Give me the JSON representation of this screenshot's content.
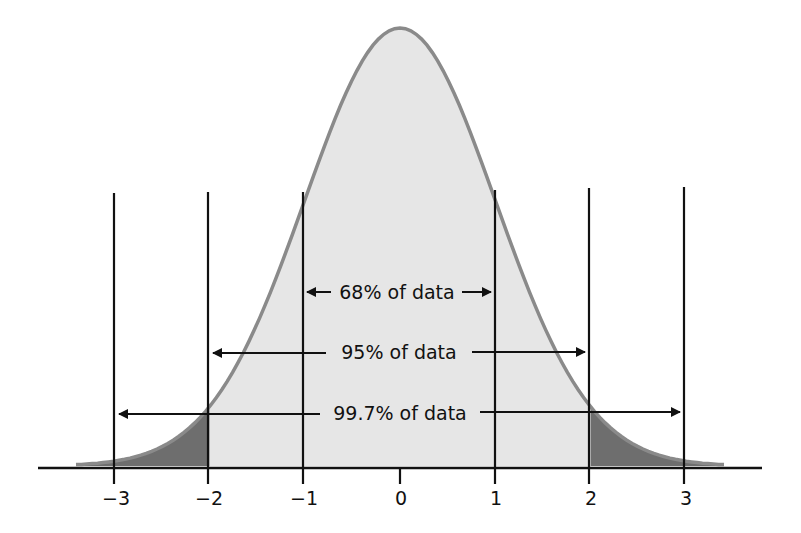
{
  "chart_data": {
    "type": "area",
    "title": "",
    "xlabel": "",
    "ylabel": "",
    "x_ticks": [
      "−3",
      "−2",
      "−1",
      "0",
      "1",
      "2",
      "3"
    ],
    "x_tick_values": [
      -3,
      -2,
      -1,
      0,
      1,
      2,
      3
    ],
    "xlim": [
      -3.4,
      3.4
    ],
    "grid": false,
    "legend": null,
    "vertical_lines_at": [
      -3,
      -2,
      -1,
      1,
      2,
      3
    ],
    "shaded_regions": [
      {
        "from": -2,
        "to": 2,
        "shade": "light",
        "color": "#e6e6e6"
      },
      {
        "from": -3.4,
        "to": -2,
        "shade": "dark",
        "color": "#6e6e6e"
      },
      {
        "from": 2,
        "to": 3.4,
        "shade": "dark",
        "color": "#6e6e6e"
      }
    ],
    "annotations": [
      {
        "label": "68% of data",
        "from": -1,
        "to": 1,
        "percent": 68
      },
      {
        "label": "95% of data",
        "from": -2,
        "to": 2,
        "percent": 95
      },
      {
        "label": "99.7% of data",
        "from": -3,
        "to": 3,
        "percent": 99.7
      }
    ],
    "curve_color": "#8a8a8a"
  },
  "labels": {
    "ticks": [
      "−3",
      "−2",
      "−1",
      "0",
      "1",
      "2",
      "3"
    ],
    "range68": "68% of data",
    "range95": "95% of data",
    "range997": "99.7% of data"
  }
}
